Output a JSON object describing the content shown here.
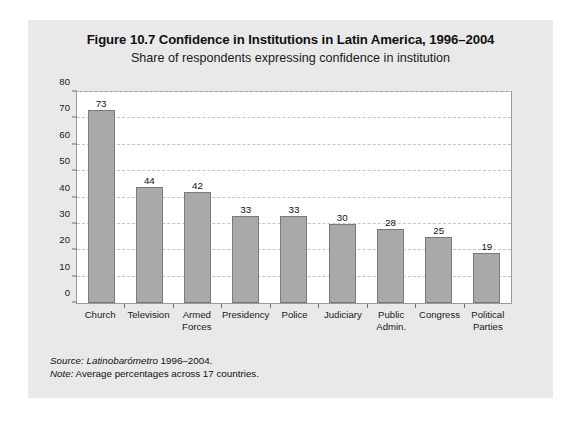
{
  "figure": {
    "title": "Figure 10.7 Confidence in Institutions in Latin America, 1996–2004",
    "subtitle": "Share of respondents expressing confidence in institution",
    "source_label": "Source:",
    "source_emphasis": "Latinobarómetro",
    "source_rest": " 1996–2004.",
    "note_label": "Note:",
    "note_text": " Average percentages across 17 countries.",
    "panel_color": "#e9e9e9",
    "plot_background": "#ffffff",
    "bar_fill": "#a9a9a9",
    "bar_stroke": "#7a7a7a",
    "gridline_color": "#c4c4c4",
    "axis_color": "#6e6e6e"
  },
  "chart_data": {
    "type": "bar",
    "title": "Figure 10.7 Confidence in Institutions in Latin America, 1996–2004",
    "subtitle": "Share of respondents expressing confidence in institution",
    "xlabel": "",
    "ylabel": "",
    "ylim": [
      0,
      80
    ],
    "yticks": [
      0,
      10,
      20,
      30,
      40,
      50,
      60,
      70,
      80
    ],
    "ytick_labels": [
      "0",
      "10",
      "20",
      "30",
      "40",
      "50",
      "60",
      "70",
      "80"
    ],
    "grid": "horizontal-dashed",
    "legend": "none",
    "categories": [
      "Church",
      "Television",
      "Armed Forces",
      "Presidency",
      "Police",
      "Judiciary",
      "Public Admin.",
      "Congress",
      "Political Parties"
    ],
    "category_lines": [
      [
        "Church"
      ],
      [
        "Television"
      ],
      [
        "Armed",
        "Forces"
      ],
      [
        "Presidency"
      ],
      [
        "Police"
      ],
      [
        "Judiciary"
      ],
      [
        "Public",
        "Admin."
      ],
      [
        "Congress"
      ],
      [
        "Political",
        "Parties"
      ]
    ],
    "values": [
      73,
      44,
      42,
      33,
      33,
      30,
      28,
      25,
      19
    ],
    "value_labels": [
      "73",
      "44",
      "42",
      "33",
      "33",
      "30",
      "28",
      "25",
      "19"
    ]
  }
}
